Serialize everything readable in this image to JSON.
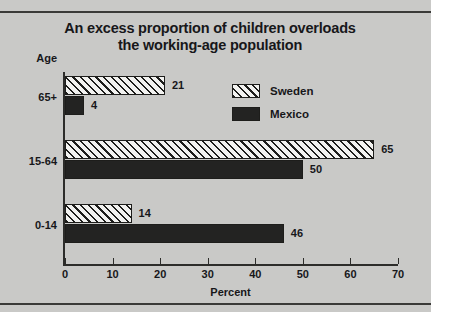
{
  "figure": {
    "title_line1": "An excess proportion of children overloads",
    "title_line2": "the  working-age population",
    "axis_head_label": "Age"
  },
  "legend": {
    "position": "top-right",
    "items": [
      {
        "label": "Sweden",
        "pattern": "diagonal-hatch",
        "color": "#f2f2f0"
      },
      {
        "label": "Mexico",
        "pattern": "solid",
        "color": "#232322"
      }
    ]
  },
  "chart_data": {
    "type": "bar",
    "orientation": "horizontal",
    "title": "An excess proportion of children overloads the working-age population",
    "categories": [
      "65+",
      "15-64",
      "0-14"
    ],
    "series": [
      {
        "name": "Sweden",
        "values": [
          21,
          65,
          14
        ]
      },
      {
        "name": "Mexico",
        "values": [
          4,
          50,
          46
        ]
      }
    ],
    "xlabel": "Percent",
    "ylabel": "Age",
    "xlim": [
      0,
      70
    ],
    "xticks": [
      0,
      10,
      20,
      30,
      40,
      50,
      60,
      70
    ],
    "xtick_labels": [
      "0",
      "10",
      "20",
      "30",
      "40",
      "50",
      "60",
      "70"
    ],
    "grid": false,
    "data_labels": [
      "21",
      "4",
      "65",
      "50",
      "14",
      "46"
    ]
  }
}
